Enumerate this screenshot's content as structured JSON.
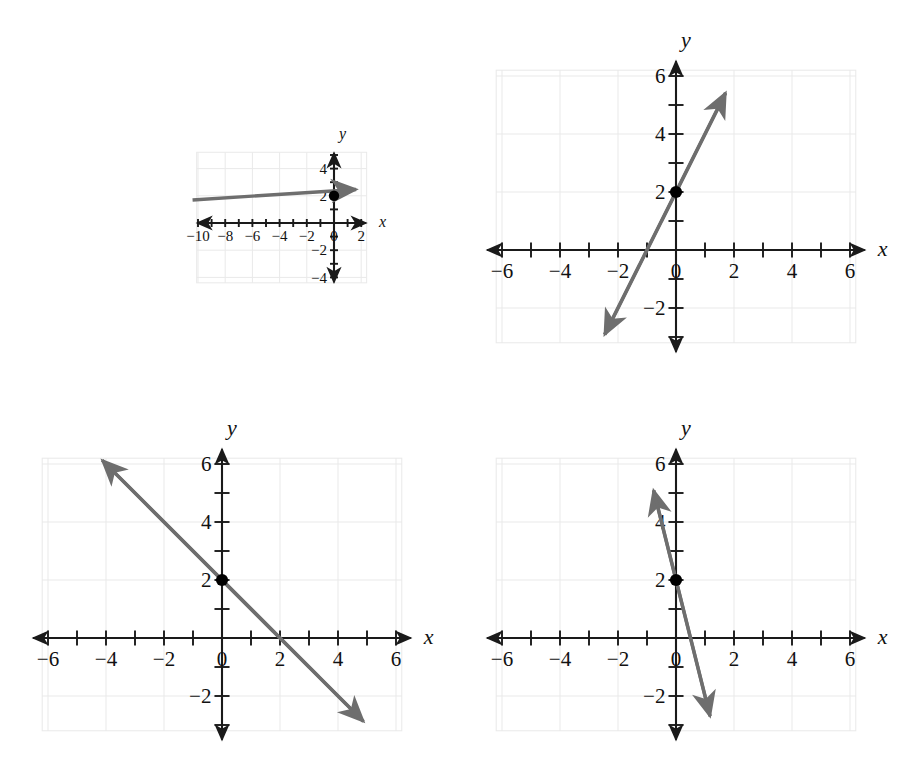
{
  "page": {
    "background": "#ffffff",
    "width": 922,
    "height": 770
  },
  "style": {
    "axis_color": "#1a1a1a",
    "line_color": "#6e6e6e",
    "grid_color": "#e9e9e9",
    "grid_minor_color": "#f2f2f2",
    "point_color": "#000000",
    "label_color": "#111111"
  },
  "chart_data": [
    {
      "id": "plot-1",
      "type": "line",
      "title": "",
      "xlabel": "x",
      "ylabel": "y",
      "xlim": [
        -10.8,
        2.8
      ],
      "ylim": [
        -4.8,
        5.6
      ],
      "grid": true,
      "grid_step": 2,
      "tick_step": 1,
      "xticks": [
        -10,
        -8,
        -6,
        -4,
        -2,
        0,
        2
      ],
      "xtick_labels": [
        "−10",
        "−8",
        "−6",
        "−4",
        "−2",
        "0",
        "2"
      ],
      "yticks": [
        -4,
        -2,
        2,
        4
      ],
      "ytick_labels": [
        "−4",
        "−2",
        "2",
        "4"
      ],
      "series": [
        {
          "name": "line-1",
          "slope": 0.2222,
          "intercept": 2,
          "x_intercept": -9,
          "from": [
            -10.4,
            1.69
          ],
          "to": [
            2.3,
            2.51
          ],
          "arrow_start": false,
          "arrow_end": true
        }
      ],
      "points": [
        {
          "x": 0,
          "y": 2,
          "label": ""
        }
      ]
    },
    {
      "id": "plot-2",
      "type": "line",
      "title": "",
      "xlabel": "x",
      "ylabel": "y",
      "xlim": [
        -6.9,
        6.9
      ],
      "ylim": [
        -3.6,
        6.9
      ],
      "grid": true,
      "grid_step": 2,
      "tick_step": 1,
      "xticks": [
        -6,
        -4,
        -2,
        0,
        2,
        4,
        6
      ],
      "xtick_labels": [
        "−6",
        "−4",
        "−2",
        "0",
        "2",
        "4",
        "6"
      ],
      "yticks": [
        -2,
        2,
        4,
        6
      ],
      "ytick_labels": [
        "−2",
        "2",
        "4",
        "6"
      ],
      "series": [
        {
          "name": "line-2",
          "slope": 2,
          "intercept": 2,
          "x_intercept": -1,
          "from": [
            -2.6,
            -3.2
          ],
          "to": [
            1.85,
            5.7
          ],
          "arrow_start": true,
          "arrow_end": true
        }
      ],
      "points": [
        {
          "x": 0,
          "y": 2,
          "label": ""
        }
      ]
    },
    {
      "id": "plot-3",
      "type": "line",
      "title": "",
      "xlabel": "x",
      "ylabel": "y",
      "xlim": [
        -6.9,
        6.9
      ],
      "ylim": [
        -3.6,
        6.9
      ],
      "grid": true,
      "grid_step": 2,
      "tick_step": 1,
      "xticks": [
        -6,
        -4,
        -2,
        0,
        2,
        4,
        6
      ],
      "xtick_labels": [
        "−6",
        "−4",
        "−2",
        "0",
        "2",
        "4",
        "6"
      ],
      "yticks": [
        -2,
        2,
        4,
        6
      ],
      "ytick_labels": [
        "−2",
        "2",
        "4",
        "6"
      ],
      "series": [
        {
          "name": "line-3",
          "slope": -1,
          "intercept": 2,
          "x_intercept": 2,
          "from": [
            -4.35,
            6.35
          ],
          "to": [
            5.1,
            -3.1
          ],
          "arrow_start": true,
          "arrow_end": true
        }
      ],
      "points": [
        {
          "x": 0,
          "y": 2,
          "label": ""
        }
      ]
    },
    {
      "id": "plot-4",
      "type": "line",
      "title": "",
      "xlabel": "x",
      "ylabel": "y",
      "xlim": [
        -6.9,
        6.9
      ],
      "ylim": [
        -3.6,
        6.9
      ],
      "grid": true,
      "grid_step": 2,
      "tick_step": 1,
      "xticks": [
        -6,
        -4,
        -2,
        0,
        2,
        4,
        6
      ],
      "xtick_labels": [
        "−6",
        "−4",
        "−2",
        "0",
        "2",
        "4",
        "6"
      ],
      "yticks": [
        -2,
        2,
        4,
        6
      ],
      "ytick_labels": [
        "−2",
        "2",
        "4",
        "6"
      ],
      "series": [
        {
          "name": "line-4",
          "slope": -4,
          "intercept": 2,
          "x_intercept": 0.5,
          "from": [
            -0.85,
            5.4
          ],
          "to": [
            1.25,
            -3.0
          ],
          "arrow_start": true,
          "arrow_end": true
        }
      ],
      "points": [
        {
          "x": 0,
          "y": 2,
          "label": ""
        }
      ]
    }
  ],
  "layout": {
    "cells": [
      {
        "id": "plot-1",
        "left": 0,
        "top": 18,
        "width": 460,
        "height": 372,
        "unit": 13.6,
        "ox": 334,
        "oy": 223,
        "gx0": -10.1,
        "gx1": 2.4,
        "gy0": -4.4,
        "gy1": 5.2
      },
      {
        "id": "plot-2",
        "left": 460,
        "top": 18,
        "width": 462,
        "height": 372,
        "unit": 29.0,
        "ox": 676,
        "oy": 250,
        "gx0": -6.2,
        "gx1": 6.2,
        "gy0": -3.2,
        "gy1": 6.2
      },
      {
        "id": "plot-3",
        "left": 0,
        "top": 400,
        "width": 460,
        "height": 370,
        "unit": 29.0,
        "ox": 222,
        "oy": 638,
        "gx0": -6.2,
        "gx1": 6.2,
        "gy0": -3.2,
        "gy1": 6.2
      },
      {
        "id": "plot-4",
        "left": 460,
        "top": 400,
        "width": 462,
        "height": 370,
        "unit": 29.0,
        "ox": 676,
        "oy": 638,
        "gx0": -6.2,
        "gx1": 6.2,
        "gy0": -3.2,
        "gy1": 6.2
      }
    ]
  }
}
